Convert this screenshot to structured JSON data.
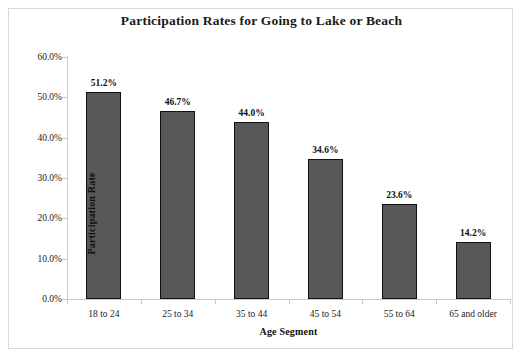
{
  "chart_data": {
    "type": "bar",
    "title": "Participation Rates for Going to Lake or Beach",
    "xlabel": "Age Segment",
    "ylabel": "Participation Rate",
    "categories": [
      "18 to 24",
      "25 to 34",
      "35 to 44",
      "45 to 54",
      "55 to 64",
      "65 and older"
    ],
    "values": [
      51.2,
      46.7,
      44.0,
      34.6,
      23.6,
      14.2
    ],
    "data_labels": [
      "51.2%",
      "46.7%",
      "44.0%",
      "34.6%",
      "23.6%",
      "14.2%"
    ],
    "ylim": [
      0,
      60
    ],
    "ytick_values": [
      0,
      10,
      20,
      30,
      40,
      50,
      60
    ],
    "ytick_labels": [
      "0.0%",
      "10.0%",
      "20.0%",
      "30.0%",
      "40.0%",
      "50.0%",
      "60.0%"
    ],
    "grid": false,
    "legend": false,
    "bar_color": "#585858",
    "bar_edge_color": "#111111",
    "axis_color": "#c9c9c9",
    "background_color": "#ffffff",
    "text_color": "#1a1a1a"
  }
}
